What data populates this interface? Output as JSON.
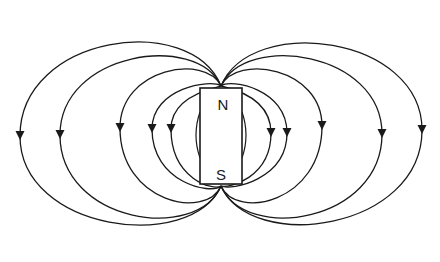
{
  "diagram": {
    "magnet": {
      "x": 200,
      "y": 88,
      "width": 42,
      "height": 96,
      "north_label": "N",
      "south_label": "S"
    },
    "colors": {
      "line": "#1a1a1a",
      "background": "#ffffff",
      "magnet_fill": "#ffffff"
    },
    "field_lines": {
      "north_anchor": {
        "x": 221,
        "y": 86
      },
      "south_anchor": {
        "x": 221,
        "y": 186
      },
      "left_extents": [
        {
          "x": 20,
          "top": 17,
          "bottom": 248,
          "arrow_y": 136
        },
        {
          "x": 60,
          "top": 37,
          "bottom": 238,
          "arrow_y": 135
        },
        {
          "x": 120,
          "top": 57,
          "bottom": 216,
          "arrow_y": 128
        },
        {
          "x": 152,
          "top": 81,
          "bottom": 192,
          "arrow_y": 129
        },
        {
          "x": 171,
          "top": 90,
          "bottom": 188,
          "arrow_y": 129
        }
      ],
      "right_extents": [
        {
          "x": 422,
          "top": 19,
          "bottom": 248,
          "arrow_y": 130
        },
        {
          "x": 382,
          "top": 37,
          "bottom": 238,
          "arrow_y": 134
        },
        {
          "x": 322,
          "top": 57,
          "bottom": 216,
          "arrow_y": 126
        },
        {
          "x": 287,
          "top": 81,
          "bottom": 188,
          "arrow_y": 133
        },
        {
          "x": 271,
          "top": 90,
          "bottom": 186,
          "arrow_y": 133
        }
      ],
      "inner_arcs": [
        {
          "side": "left",
          "x": 196,
          "top": 112,
          "bottom": 158
        },
        {
          "side": "right",
          "x": 246,
          "top": 112,
          "bottom": 158
        }
      ],
      "arrow_direction": "down"
    }
  }
}
